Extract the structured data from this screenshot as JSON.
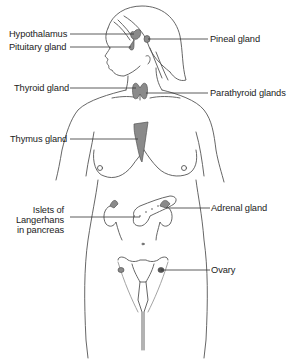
{
  "diagram": {
    "labels": {
      "hypothalamus": "Hypothalamus",
      "pituitary": "Pituitary gland",
      "thyroid": "Thyroid gland",
      "thymus": "Thymus gland",
      "islets_line1": "Islets of",
      "islets_line2": "Langerhans",
      "islets_line3": "in pancreas",
      "pineal": "Pineal gland",
      "parathyroid": "Parathyroid glands",
      "adrenal": "Adrenal gland",
      "ovary": "Ovary"
    },
    "colors": {
      "outline": "#444444",
      "gland_fill": "#8a8a8a",
      "gland_dark": "#555555",
      "leader_line": "#333333",
      "background": "#ffffff"
    }
  }
}
